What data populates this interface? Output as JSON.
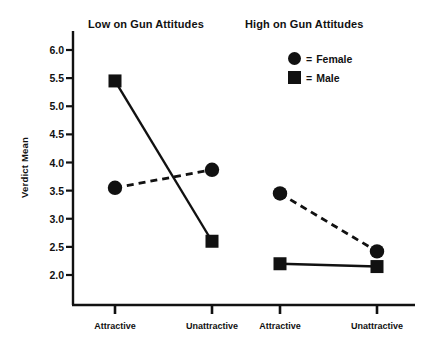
{
  "chart_data": {
    "type": "line",
    "title": "",
    "xlabel": "",
    "ylabel": "Verdict Mean",
    "ylim": [
      1.72,
      6.28
    ],
    "yticks": [
      "2.0",
      "2.5",
      "3.0",
      "3.5",
      "4.0",
      "4.5",
      "5.0",
      "5.5",
      "6.0"
    ],
    "ytick_values": [
      2.0,
      2.5,
      3.0,
      3.5,
      4.0,
      4.5,
      5.0,
      5.5,
      6.0
    ],
    "grid": false,
    "legend_position": "top-right",
    "categories": [
      "Attractive",
      "Unattractive",
      "Attractive",
      "Unattractive"
    ],
    "panels": [
      {
        "title": "Low on Gun Attitudes",
        "categories": [
          "Attractive",
          "Unattractive"
        ],
        "series": [
          {
            "name": "Male",
            "marker": "square",
            "line": "solid",
            "values": [
              5.45,
              2.6
            ]
          },
          {
            "name": "Female",
            "marker": "circle",
            "line": "dashed",
            "values": [
              3.55,
              3.87
            ]
          }
        ]
      },
      {
        "title": "High on Gun Attitudes",
        "categories": [
          "Attractive",
          "Unattractive"
        ],
        "series": [
          {
            "name": "Male",
            "marker": "square",
            "line": "solid",
            "values": [
              2.2,
              2.15
            ]
          },
          {
            "name": "Female",
            "marker": "circle",
            "line": "dashed",
            "values": [
              3.45,
              2.42
            ]
          }
        ]
      }
    ],
    "legend": [
      {
        "marker": "circle",
        "equals": "=",
        "label": "Female"
      },
      {
        "marker": "square",
        "equals": "=",
        "label": "Male"
      }
    ],
    "colors": {
      "ink": "#111111",
      "background": "#ffffff"
    }
  },
  "axis": {
    "y_label": "Verdict Mean",
    "y_ticks": [
      "6.0",
      "5.5",
      "5.0",
      "4.5",
      "4.0",
      "3.5",
      "3.0",
      "2.5",
      "2.0"
    ],
    "x_ticks": [
      "Attractive",
      "Unattractive",
      "Attractive",
      "Unattractive"
    ]
  },
  "titles": {
    "low": "Low on Gun Attitudes",
    "high": "High on Gun Attitudes"
  },
  "legend": {
    "female_eq": "=",
    "female_label": "Female",
    "male_eq": "=",
    "male_label": "Male"
  }
}
